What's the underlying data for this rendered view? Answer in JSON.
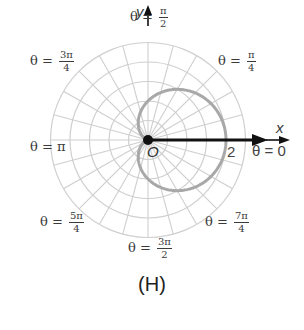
{
  "figure": {
    "caption": "(H)",
    "axes": {
      "x_label": "x",
      "y_label": "y",
      "origin_label": "O"
    },
    "radial_tick_label": "2",
    "angle_labels": {
      "theta0": {
        "prefix": "θ = ",
        "value": "0"
      },
      "theta_pi4": {
        "prefix": "θ = ",
        "num": "π",
        "den": "4"
      },
      "theta_pi2": {
        "prefix": "θ = ",
        "num": "π",
        "den": "2"
      },
      "theta_3pi4": {
        "prefix": "θ = ",
        "num": "3π",
        "den": "4"
      },
      "theta_pi": {
        "prefix": "θ = ",
        "value": "π"
      },
      "theta_5pi4": {
        "prefix": "θ = ",
        "num": "5π",
        "den": "4"
      },
      "theta_3pi2": {
        "prefix": "θ = ",
        "num": "3π",
        "den": "2"
      },
      "theta_7pi4": {
        "prefix": "θ = ",
        "num": "7π",
        "den": "4"
      }
    },
    "colors": {
      "grid": "#cfcfcf",
      "curve": "#a8a8a8",
      "axis": "#111111",
      "text": "#3a3a3a"
    }
  },
  "chart_data": {
    "type": "polar",
    "title": "(H)",
    "curve": "cardioid r = 1 + cos θ",
    "equation": "r = 1 + cos(theta)",
    "points": [
      {
        "theta": "0",
        "r": 2
      },
      {
        "theta": "π/4",
        "r": 1.71
      },
      {
        "theta": "π/2",
        "r": 1
      },
      {
        "theta": "3π/4",
        "r": 0.29
      },
      {
        "theta": "π",
        "r": 0
      },
      {
        "theta": "5π/4",
        "r": 0.29
      },
      {
        "theta": "3π/2",
        "r": 1
      },
      {
        "theta": "7π/4",
        "r": 1.71
      }
    ],
    "grid": {
      "rings": [
        0.5,
        1,
        1.5,
        2,
        2.5
      ],
      "radial_lines_every_deg": 15
    },
    "r_tick_labels": [
      "2"
    ],
    "angle_tick_labels": [
      "θ = 0",
      "θ = π/4",
      "θ = π/2",
      "θ = 3π/4",
      "θ = π",
      "θ = 5π/4",
      "θ = 3π/2",
      "θ = 7π/4"
    ],
    "xlabel": "x",
    "ylabel": "y",
    "rlim": [
      0,
      2.5
    ]
  }
}
